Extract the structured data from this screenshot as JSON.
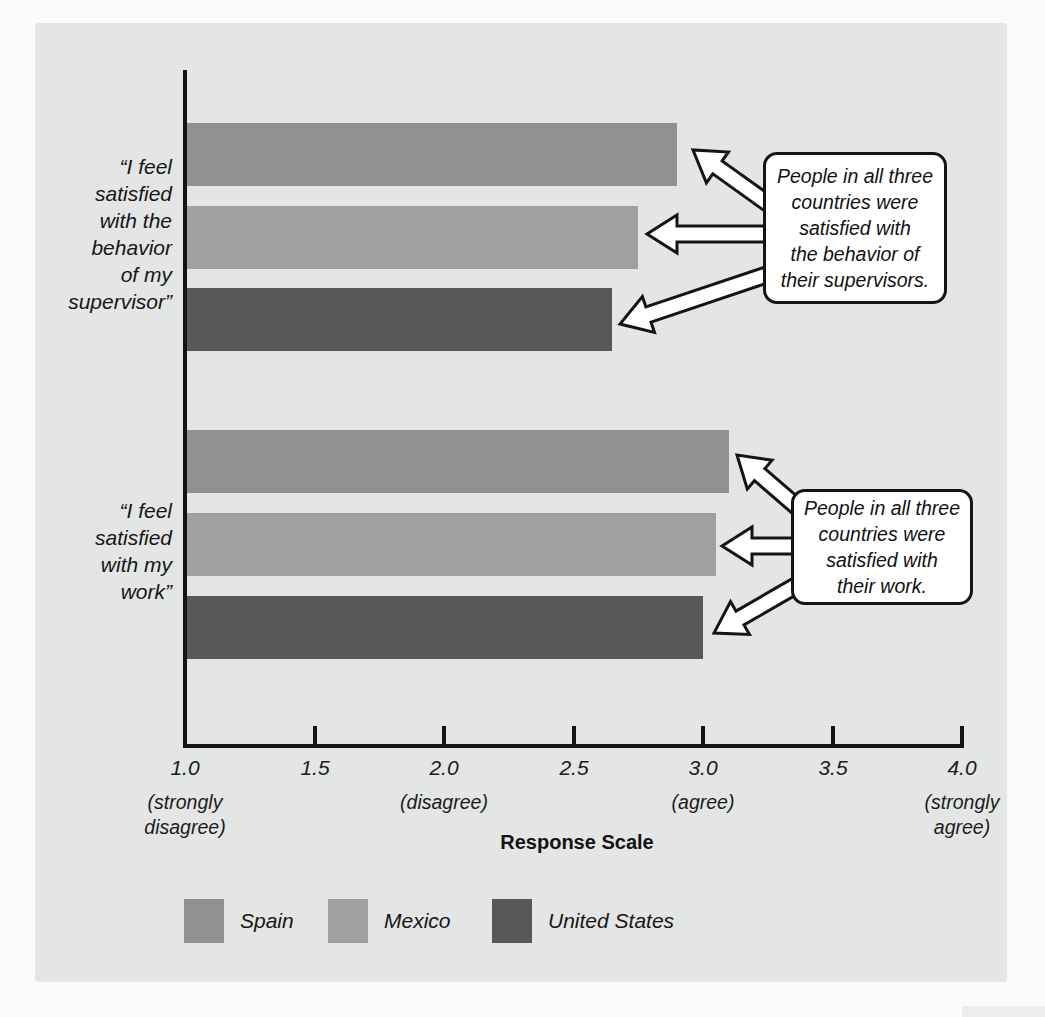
{
  "page": {
    "background": "#fbfbfa"
  },
  "panel": {
    "background": "#e4e5e5"
  },
  "chart_data": {
    "type": "bar",
    "orientation": "horizontal",
    "title": "",
    "xlabel": "Response Scale",
    "ylabel": "",
    "xlim": [
      1.0,
      4.0
    ],
    "grid": false,
    "x_ticks": [
      1.0,
      1.5,
      2.0,
      2.5,
      3.0,
      3.5,
      4.0
    ],
    "x_tick_labels": [
      "1.0",
      "1.5",
      "2.0",
      "2.5",
      "3.0",
      "3.5",
      "4.0"
    ],
    "x_scale_annotations": [
      {
        "value": 1.0,
        "lines": [
          "(strongly",
          "disagree)"
        ]
      },
      {
        "value": 2.0,
        "lines": [
          "(disagree)"
        ]
      },
      {
        "value": 3.0,
        "lines": [
          "(agree)"
        ]
      },
      {
        "value": 4.0,
        "lines": [
          "(strongly",
          "agree)"
        ]
      }
    ],
    "categories": [
      "“I feel satisfied with the behavior of my supervisor”",
      "“I feel satisfied with my work”"
    ],
    "category_label_lines": [
      [
        "“I feel",
        "satisfied",
        "with the",
        "behavior",
        "of my",
        "supervisor”"
      ],
      [
        "“I feel",
        "satisfied",
        "with my",
        "work”"
      ]
    ],
    "series": [
      {
        "name": "Spain",
        "color": "#8f9192",
        "values": [
          2.9,
          3.1
        ]
      },
      {
        "name": "Mexico",
        "color": "#9ea0a1",
        "values": [
          2.75,
          3.05
        ]
      },
      {
        "name": "United States",
        "color": "#57585a",
        "values": [
          2.65,
          3.0
        ]
      }
    ],
    "legend": {
      "position": "bottom",
      "entries": [
        "Spain",
        "Mexico",
        "United States"
      ]
    },
    "annotations": [
      {
        "text": "People in all three countries were satisfied with the behavior of their supervisors.",
        "lines": [
          "People in all three",
          "countries were",
          "satisfied with",
          "the behavior of",
          "their supervisors."
        ]
      },
      {
        "text": "People in all three countries were satisfied with their work.",
        "lines": [
          "People in all three",
          "countries were",
          "satisfied with",
          "their work."
        ]
      }
    ]
  }
}
